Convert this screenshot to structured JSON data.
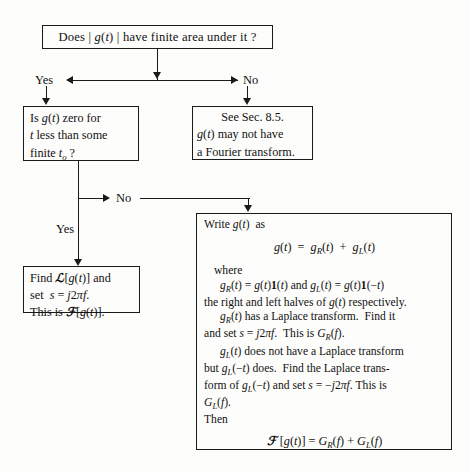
{
  "diagram": {
    "nodes": {
      "top_question": {
        "text": "Does | g(t) | have finite area under it ?"
      },
      "left_decision": {
        "line1": "Is g(t) zero for",
        "line2": "t less than some",
        "line3": "finite t₀ ?"
      },
      "see_sec": {
        "line1": "See Sec. 8.5.",
        "line2": "g(t) may not have",
        "line3": "a Fourier transform."
      },
      "left_result": {
        "line1": "Find ℒ[g(t)] and",
        "line2": "set s = j2πf.",
        "line3": "This is ℱ[g(t)]."
      },
      "big_box": {
        "line1": "Write g(t) as",
        "equation1": "g(t) = gR(t) + gL(t)",
        "line2": "where",
        "line3": "gR(t) = g(t)1(t) and gL(t) = g(t)1(−t)",
        "line4": "the right and left halves of g(t) respectively.",
        "line5": "gR(t) has a Laplace transform.  Find it",
        "line6": "and set s = j2πf.  This is GR(f).",
        "line7": "gL(t) does not have a Laplace transform",
        "line8": "but gL(−t) does.  Find the Laplace trans-",
        "line9": "form of gL(−t) and set s = −j2πf.  This is",
        "line10": "GL(f).",
        "line11": "Then",
        "equation2": "ℱ [g(t)] = GR(f) + GL(f)"
      }
    },
    "edge_labels": {
      "yes_top": "Yes",
      "no_top": "No",
      "no_second": "No",
      "yes_second": "Yes"
    },
    "colors": {
      "stroke": "#1a1a1a",
      "background": "#fdfdfb",
      "text": "#111111"
    }
  }
}
